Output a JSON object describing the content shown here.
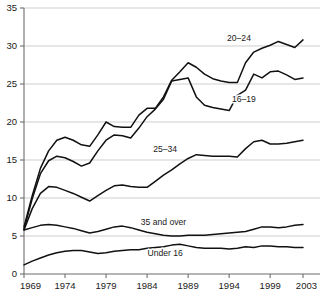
{
  "chart_data": {
    "type": "line",
    "title": "",
    "subtitle": "",
    "xlabel": "",
    "ylabel": "",
    "xlim": [
      1969,
      2003
    ],
    "ylim": [
      0,
      35
    ],
    "grid": true,
    "legend_position": "inline-labels",
    "x": [
      1969,
      1970,
      1971,
      1972,
      1973,
      1974,
      1975,
      1976,
      1977,
      1978,
      1979,
      1980,
      1981,
      1982,
      1983,
      1984,
      1985,
      1986,
      1987,
      1988,
      1989,
      1990,
      1991,
      1992,
      1993,
      1994,
      1995,
      1996,
      1997,
      1998,
      1999,
      2000,
      2001,
      2002,
      2003
    ],
    "x_ticks": [
      1969,
      1974,
      1979,
      1984,
      1989,
      1994,
      1999,
      2003
    ],
    "x_tick_labels": [
      "1969",
      "1974",
      "1979",
      "1984",
      "1989",
      "1994",
      "1999",
      "2003"
    ],
    "y_ticks": [
      0,
      5,
      10,
      15,
      20,
      25,
      30,
      35
    ],
    "y_tick_labels": [
      "0",
      "5",
      "10",
      "15",
      "20",
      "25",
      "30",
      "35"
    ],
    "series": [
      {
        "name": "20–24",
        "label": "20–24",
        "label_x": 1995.2,
        "label_y": 30.6,
        "color": "#111111",
        "values": [
          6.2,
          10.3,
          13.9,
          16.2,
          17.6,
          18.0,
          17.6,
          17.0,
          16.8,
          18.3,
          20.0,
          19.4,
          19.3,
          19.3,
          20.9,
          21.8,
          21.8,
          23.3,
          25.5,
          26.6,
          27.8,
          27.2,
          26.3,
          25.7,
          25.4,
          25.2,
          25.2,
          27.8,
          29.2,
          29.7,
          30.1,
          30.6,
          30.2,
          29.8,
          30.8
        ]
      },
      {
        "name": "16–19",
        "label": "16–19",
        "label_x": 1995.8,
        "label_y": 22.6,
        "color": "#111111",
        "values": [
          5.9,
          9.9,
          13.2,
          14.9,
          15.5,
          15.3,
          14.8,
          14.2,
          14.6,
          16.2,
          17.6,
          18.3,
          18.2,
          17.9,
          19.2,
          20.7,
          21.7,
          23.0,
          25.4,
          25.6,
          25.8,
          23.3,
          22.2,
          21.9,
          21.7,
          21.5,
          23.5,
          24.2,
          26.3,
          25.8,
          26.6,
          26.7,
          26.2,
          25.6,
          25.8
        ]
      },
      {
        "name": "25–34",
        "label": "25–34",
        "label_x": 1986.2,
        "label_y": 16.1,
        "color": "#111111",
        "values": [
          5.8,
          8.6,
          10.6,
          11.5,
          11.4,
          11.0,
          10.6,
          10.1,
          9.6,
          10.3,
          11.0,
          11.6,
          11.7,
          11.5,
          11.4,
          11.4,
          12.2,
          13.0,
          13.7,
          14.5,
          15.2,
          15.7,
          15.6,
          15.5,
          15.5,
          15.5,
          15.4,
          16.5,
          17.4,
          17.6,
          17.1,
          17.1,
          17.2,
          17.4,
          17.6
        ]
      },
      {
        "name": "35 and over",
        "label": "35 and over",
        "label_x": 1986.0,
        "label_y": 6.4,
        "color": "#111111",
        "values": [
          5.8,
          6.1,
          6.4,
          6.5,
          6.4,
          6.2,
          6.0,
          5.7,
          5.4,
          5.6,
          5.9,
          6.2,
          6.3,
          6.1,
          5.8,
          5.5,
          5.3,
          5.1,
          5.0,
          5.0,
          5.1,
          5.1,
          5.1,
          5.2,
          5.3,
          5.4,
          5.5,
          5.6,
          5.9,
          6.2,
          6.2,
          6.1,
          6.2,
          6.4,
          6.5
        ]
      },
      {
        "name": "Under 16",
        "label": "Under 16",
        "label_x": 1986.2,
        "label_y": 2.4,
        "color": "#111111",
        "values": [
          1.2,
          1.7,
          2.1,
          2.5,
          2.8,
          3.0,
          3.1,
          3.1,
          2.9,
          2.7,
          2.8,
          3.0,
          3.1,
          3.2,
          3.2,
          3.4,
          3.5,
          3.6,
          3.8,
          3.9,
          3.7,
          3.5,
          3.4,
          3.4,
          3.4,
          3.3,
          3.4,
          3.6,
          3.5,
          3.7,
          3.7,
          3.6,
          3.6,
          3.5,
          3.5
        ]
      }
    ]
  },
  "axes": {
    "y_axis_name": "y-axis",
    "x_axis_name": "x-axis"
  }
}
